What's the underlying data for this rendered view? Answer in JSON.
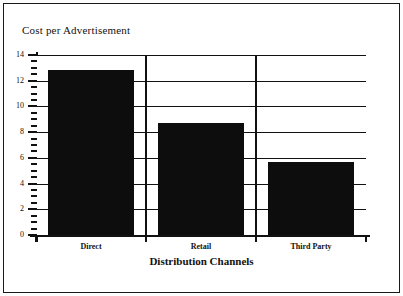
{
  "figure": {
    "background_color": "#ffffff",
    "frame_color": "#1a1a1a",
    "ink_color": "#111111",
    "bar_color": "#0d0d0d"
  },
  "chart_data": {
    "type": "bar",
    "title": "Cost per Advertisement",
    "xlabel": "Distribution Channels",
    "ylabel": "",
    "categories": [
      "Direct",
      "Retail",
      "Third Party"
    ],
    "values": [
      12.8,
      8.7,
      5.7
    ],
    "ylim": [
      0,
      14
    ],
    "y_major_ticks": [
      0,
      2,
      4,
      6,
      8,
      10,
      12,
      14
    ],
    "y_tick_labels": [
      "0",
      "2",
      "4",
      "6",
      "8",
      "10",
      "12",
      "14"
    ],
    "y_minor_tick_interval": 0.5,
    "grid": true,
    "grid_axis": "y",
    "legend": null,
    "series": [
      {
        "name": "Cost per Advertisement",
        "values": [
          12.8,
          8.7,
          5.7
        ]
      }
    ]
  }
}
